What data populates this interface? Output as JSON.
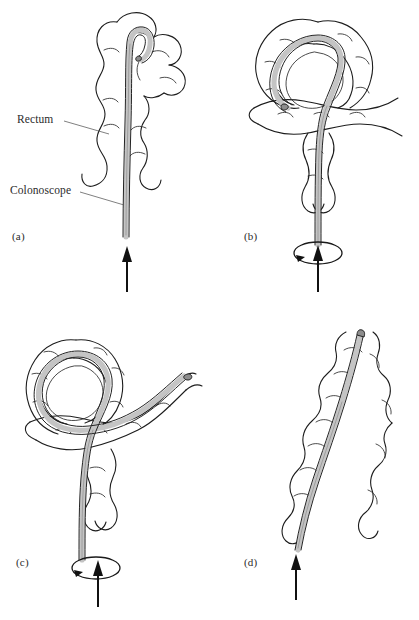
{
  "figure": {
    "background_color": "#ffffff",
    "ink_color": "#1d1d1d",
    "scope_fill_color": "#c9c9c9",
    "panel_count": 4
  },
  "annotations": {
    "rectum_label": "Rectum",
    "colonoscope_label": "Colonoscope"
  },
  "panels": [
    {
      "id": "a",
      "label": "(a)",
      "caption_text": "(a)",
      "description": "Colonoscope advanced straight through the rectum with the tip curved over at the top",
      "arrow": "push-up",
      "rotation_indicator": false
    },
    {
      "id": "b",
      "label": "(b)",
      "caption_text": "(b)",
      "description": "Sigmoid loop formed; scope follows a circular alpha loop",
      "arrow": "push-up",
      "rotation_indicator": true
    },
    {
      "id": "c",
      "label": "(c)",
      "caption_text": "(c)",
      "description": "Scope advanced further through the loop and exiting to the upper right",
      "arrow": "push-up",
      "rotation_indicator": true
    },
    {
      "id": "d",
      "label": "(d)",
      "caption_text": "(d)",
      "description": "Loop reduced; scope straightened with the colon accordioned over it",
      "arrow": "push-up",
      "rotation_indicator": false
    }
  ]
}
